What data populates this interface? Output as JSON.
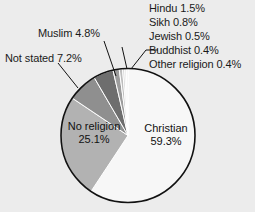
{
  "chart_data": {
    "type": "pie",
    "title": "",
    "xlabel": "",
    "ylabel": "",
    "unit": "%",
    "legend_position": "labels-with-leader-lines",
    "grid": false,
    "categories": [
      "Christian",
      "No religion",
      "Not stated",
      "Muslim",
      "Hindu",
      "Sikh",
      "Jewish",
      "Buddhist",
      "Other religion"
    ],
    "values": [
      59.3,
      25.1,
      7.2,
      4.8,
      1.5,
      0.8,
      0.5,
      0.4,
      0.4
    ],
    "slice_colors": [
      "#f7f7f7",
      "#b2b2b2",
      "#8f8f8f",
      "#6e6e6e",
      "#9c9c9c",
      "#bdbdbd",
      "#d2d2d2",
      "#e2e2e2",
      "#efefef"
    ],
    "start_angle_deg": 0,
    "direction": "clockwise",
    "slices": [
      {
        "label": "Christian",
        "value": 59.3,
        "value_text": "59.3%",
        "color": "#f7f7f7",
        "label_placement": "inside"
      },
      {
        "label": "No religion",
        "value": 25.1,
        "value_text": "25.1%",
        "color": "#b2b2b2",
        "label_placement": "inside"
      },
      {
        "label": "Not stated",
        "value": 7.2,
        "value_text": "7.2%",
        "color": "#8f8f8f",
        "label_placement": "outside-left"
      },
      {
        "label": "Muslim",
        "value": 4.8,
        "value_text": "4.8%",
        "color": "#6e6e6e",
        "label_placement": "outside-left"
      },
      {
        "label": "Hindu",
        "value": 1.5,
        "value_text": "1.5%",
        "color": "#9c9c9c",
        "label_placement": "outside-right"
      },
      {
        "label": "Sikh",
        "value": 0.8,
        "value_text": "0.8%",
        "color": "#bdbdbd",
        "label_placement": "outside-right"
      },
      {
        "label": "Jewish",
        "value": 0.5,
        "value_text": "0.5%",
        "color": "#d2d2d2",
        "label_placement": "outside-right"
      },
      {
        "label": "Buddhist",
        "value": 0.4,
        "value_text": "0.4%",
        "color": "#e2e2e2",
        "label_placement": "outside-right"
      },
      {
        "label": "Other religion",
        "value": 0.4,
        "value_text": "0.4%",
        "color": "#efefef",
        "label_placement": "outside-right"
      }
    ]
  },
  "labels": {
    "right_stack": [
      "Hindu 1.5%",
      "Sikh 0.8%",
      "Jewish 0.5%",
      "Buddhist 0.4%",
      "Other religion 0.4%"
    ],
    "muslim": "Muslim 4.8%",
    "not_stated": "Not stated 7.2%",
    "no_religion_name": "No religion",
    "no_religion_pct": "25.1%",
    "christian_name": "Christian",
    "christian_pct": "59.3%"
  },
  "style": {
    "background": "#ececec",
    "outline": "#000000",
    "text": "#1a1a1a"
  }
}
